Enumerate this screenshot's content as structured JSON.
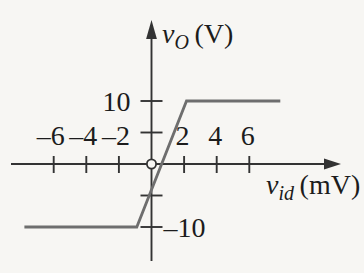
{
  "figure": {
    "background": "#f7f6f3"
  },
  "colors": {
    "axis": "#333333",
    "text": "#1c1c1c",
    "curve": "#6e6e6e",
    "marker_fill": "#f7f6f3"
  },
  "chart_data": {
    "type": "line",
    "title": "",
    "xlabel": "v_id (mV)",
    "ylabel": "v_O (V)",
    "x_axis": {
      "variable": "v",
      "subscript": "id",
      "unit": "(mV)",
      "range": [
        -8.7,
        11.8
      ],
      "ticks": [
        {
          "value": -6,
          "label": "–6"
        },
        {
          "value": -4,
          "label": "–4"
        },
        {
          "value": -2,
          "label": "–2"
        },
        {
          "value": 2,
          "label": "2"
        },
        {
          "value": 4,
          "label": "4"
        },
        {
          "value": 6,
          "label": "6"
        }
      ]
    },
    "y_axis": {
      "variable": "v",
      "subscript": "O",
      "unit": "(V)",
      "range": [
        -15.5,
        23
      ],
      "ticks": [
        {
          "value": 10,
          "label": "10",
          "label_side": "left"
        },
        {
          "value": 5,
          "label": "",
          "label_side": "none"
        },
        {
          "value": -5,
          "label": "",
          "label_side": "none"
        },
        {
          "value": -10,
          "label": "–10",
          "label_side": "right"
        }
      ]
    },
    "series": [
      {
        "name": "transfer-characteristic",
        "color": "#6e6e6e",
        "points": [
          [
            -7.8,
            -10
          ],
          [
            -0.9,
            -10
          ],
          [
            2.15,
            10
          ],
          [
            7.9,
            10
          ]
        ]
      }
    ],
    "origin_marker": {
      "shape": "open-circle",
      "x": 0,
      "y": 0
    },
    "positive_saturation_V": 10,
    "negative_saturation_V": -10
  }
}
